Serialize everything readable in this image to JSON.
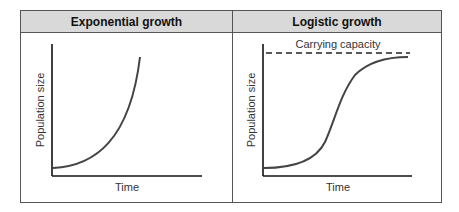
{
  "panels": [
    {
      "title": "Exponential growth",
      "xlabel": "Time",
      "ylabel": "Population size"
    },
    {
      "title": "Logistic growth",
      "xlabel": "Time",
      "ylabel": "Population size",
      "annotation": "Carrying capacity"
    }
  ],
  "colors": {
    "header_bg": "#d9d9d9",
    "border": "#555555",
    "curve": "#444444",
    "axis": "#111111"
  }
}
